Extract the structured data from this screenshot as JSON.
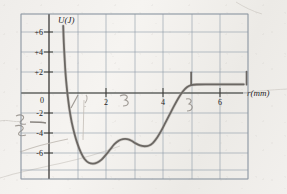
{
  "figure": {
    "media": "scanned-textbook-graph",
    "axis_label_y": "U(J)",
    "axis_label_x": "r(mm)",
    "pen_color": "#6b6763",
    "grid_color": "#9aa3b0",
    "axis_color": "#3a3632",
    "ink_color": "#26231f",
    "annotation_color": "#8d8781"
  },
  "annotations": [
    {
      "text": "3",
      "x": 18,
      "y": 128
    },
    {
      "text": "1",
      "x": 73,
      "y": 104
    },
    {
      "text": "3",
      "x": 124,
      "y": 103
    },
    {
      "text": "5",
      "x": 186,
      "y": 105
    }
  ],
  "chart_data": {
    "type": "line",
    "title": "",
    "subtitle": "",
    "xlabel": "r(mm)",
    "ylabel": "U(J)",
    "xlim": [
      0,
      7
    ],
    "ylim": [
      -7,
      7
    ],
    "grid": true,
    "legend": "none",
    "xticks": [
      2,
      4,
      6
    ],
    "xtick_labels": [
      "2",
      "4",
      "6"
    ],
    "yticks": [
      6,
      4,
      2,
      0,
      -2,
      -4,
      -6
    ],
    "ytick_labels": [
      "+6",
      "+4",
      "+2",
      "0",
      "-2",
      "-4",
      "-6"
    ],
    "x_gridlines": [
      0,
      1,
      2,
      3,
      4,
      5,
      6,
      7
    ],
    "y_gridlines": [
      -7,
      -6,
      -4,
      -2,
      0,
      2,
      4,
      6,
      7
    ],
    "series": [
      {
        "name": "potential-energy",
        "points": [
          [
            0.5,
            6.0
          ],
          [
            0.52,
            4.6
          ],
          [
            0.55,
            3.2
          ],
          [
            0.58,
            2.0
          ],
          [
            0.62,
            0.9
          ],
          [
            0.66,
            0.0
          ],
          [
            0.72,
            -1.1
          ],
          [
            0.8,
            -2.2
          ],
          [
            0.9,
            -3.2
          ],
          [
            1.0,
            -4.0
          ],
          [
            1.12,
            -4.75
          ],
          [
            1.25,
            -5.3
          ],
          [
            1.4,
            -5.62
          ],
          [
            1.55,
            -5.7
          ],
          [
            1.7,
            -5.6
          ],
          [
            1.85,
            -5.35
          ],
          [
            2.0,
            -4.95
          ],
          [
            2.15,
            -4.5
          ],
          [
            2.3,
            -4.05
          ],
          [
            2.45,
            -3.75
          ],
          [
            2.6,
            -3.62
          ],
          [
            2.75,
            -3.62
          ],
          [
            2.9,
            -3.75
          ],
          [
            3.05,
            -3.98
          ],
          [
            3.2,
            -4.15
          ],
          [
            3.35,
            -4.22
          ],
          [
            3.5,
            -4.18
          ],
          [
            3.65,
            -3.95
          ],
          [
            3.8,
            -3.5
          ],
          [
            3.95,
            -2.9
          ],
          [
            4.1,
            -2.2
          ],
          [
            4.25,
            -1.5
          ],
          [
            4.4,
            -0.8
          ],
          [
            4.55,
            -0.15
          ],
          [
            4.7,
            0.4
          ],
          [
            4.85,
            0.78
          ],
          [
            5.0,
            0.96
          ],
          [
            5.2,
            1.02
          ],
          [
            5.6,
            1.03
          ],
          [
            6.0,
            1.03
          ],
          [
            6.4,
            1.03
          ],
          [
            6.85,
            1.03
          ]
        ]
      }
    ],
    "vertical_markers": [
      {
        "x": 5.0,
        "y_from": 1.0,
        "y_to": 2.05
      },
      {
        "x": 6.95,
        "y_from": 1.0,
        "y_to": 2.1
      }
    ]
  }
}
